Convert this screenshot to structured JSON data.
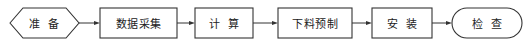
{
  "diagram": {
    "type": "flowchart",
    "direction": "left-to-right",
    "stroke_color": "#333333",
    "nodes": [
      {
        "id": "prepare",
        "shape": "hexagon",
        "label": "准  备"
      },
      {
        "id": "data-collection",
        "shape": "rectangle",
        "label": "数据采集"
      },
      {
        "id": "calculate",
        "shape": "rectangle",
        "label": "计  算"
      },
      {
        "id": "prefabrication",
        "shape": "rectangle",
        "label": "下料预制"
      },
      {
        "id": "install",
        "shape": "rectangle",
        "label": "安  装"
      },
      {
        "id": "inspect",
        "shape": "terminal",
        "label": "检  查"
      }
    ],
    "edges": [
      {
        "from": "prepare",
        "to": "data-collection"
      },
      {
        "from": "data-collection",
        "to": "calculate"
      },
      {
        "from": "calculate",
        "to": "prefabrication"
      },
      {
        "from": "prefabrication",
        "to": "install"
      },
      {
        "from": "install",
        "to": "inspect"
      }
    ]
  }
}
